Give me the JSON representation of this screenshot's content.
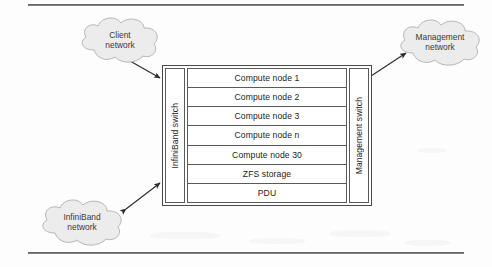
{
  "figure": {
    "background_color": "#fdfdfd",
    "line_color": "#4a4a4a"
  },
  "rack": {
    "left_switch": {
      "label": "InfiniBand switch",
      "orientation": "vertical"
    },
    "right_switch": {
      "label": "Management switch",
      "orientation": "vertical"
    },
    "nodes": [
      {
        "label": "Compute node 1"
      },
      {
        "label": "Compute node 2"
      },
      {
        "label": "Compute node 3"
      },
      {
        "label": "Compute node n"
      },
      {
        "label": "Compute node 30"
      },
      {
        "label": "ZFS storage"
      },
      {
        "label": "PDU"
      }
    ]
  },
  "clouds": [
    {
      "id": "client",
      "label": "Client\nnetwork"
    },
    {
      "id": "management",
      "label": "Management\nnetwork"
    },
    {
      "id": "infiniband",
      "label": "InfiniBand\nnetwork"
    }
  ],
  "connections": [
    {
      "from": "client-network-cloud",
      "to": "infiniband-switch",
      "style": "double-arrow"
    },
    {
      "from": "infiniband-network-cloud",
      "to": "infiniband-switch",
      "style": "double-arrow"
    },
    {
      "from": "management-network-cloud",
      "to": "management-switch",
      "style": "double-arrow"
    }
  ]
}
